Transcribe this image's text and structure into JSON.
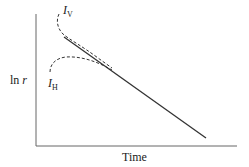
{
  "diagram": {
    "xlabel": "Time",
    "ylabel_prefix": "ln ",
    "ylabel_var": "r",
    "curves": [
      {
        "name": "I",
        "subscript": "V",
        "style": "dashed"
      },
      {
        "name": "I",
        "subscript": "H",
        "style": "dashed"
      },
      {
        "name": "asymptote",
        "style": "solid"
      }
    ],
    "colors": {
      "line": "#333333",
      "axis": "#555555"
    }
  }
}
